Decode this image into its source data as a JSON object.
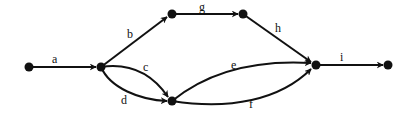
{
  "diagram": {
    "type": "directed-graph",
    "nodes": [
      {
        "id": "n0",
        "x": 29,
        "y": 67
      },
      {
        "id": "n1",
        "x": 101,
        "y": 67
      },
      {
        "id": "n2",
        "x": 172,
        "y": 14
      },
      {
        "id": "n3",
        "x": 243,
        "y": 14
      },
      {
        "id": "n4",
        "x": 316,
        "y": 65
      },
      {
        "id": "n5",
        "x": 388,
        "y": 65
      },
      {
        "id": "n6",
        "x": 172,
        "y": 101
      }
    ],
    "edges": [
      {
        "label": "a",
        "from": "n0",
        "to": "n1"
      },
      {
        "label": "b",
        "from": "n1",
        "to": "n2"
      },
      {
        "label": "c",
        "from": "n1",
        "to": "n6"
      },
      {
        "label": "d",
        "from": "n1",
        "to": "n6"
      },
      {
        "label": "g",
        "from": "n2",
        "to": "n3"
      },
      {
        "label": "h",
        "from": "n3",
        "to": "n4"
      },
      {
        "label": "e",
        "from": "n6",
        "to": "n4"
      },
      {
        "label": "f",
        "from": "n6",
        "to": "n4"
      },
      {
        "label": "i",
        "from": "n4",
        "to": "n5"
      }
    ],
    "labels": {
      "a": "a",
      "b": "b",
      "c": "c",
      "d": "d",
      "e": "e",
      "f": "f",
      "g": "g",
      "h": "h",
      "i": "i"
    }
  }
}
